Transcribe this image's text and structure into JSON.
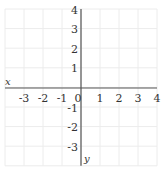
{
  "chart_data": {
    "type": "line",
    "title": "",
    "xlabel": "x",
    "ylabel": "y",
    "xlim": [
      -4,
      4
    ],
    "ylim": [
      -4,
      4
    ],
    "grid": true,
    "x_ticks": [
      -3,
      -2,
      -1,
      0,
      1,
      2,
      3,
      4
    ],
    "y_ticks": [
      4,
      3,
      2,
      1,
      0,
      -1,
      -2,
      -3
    ],
    "series": []
  },
  "colors": {
    "grid": "#ececec",
    "axis": "#555555",
    "text": "#333333"
  },
  "layout": {
    "grid_left": 5,
    "grid_top": 9,
    "cell": 19,
    "cols": 8,
    "rows": 8,
    "origin_x": 81,
    "origin_y": 88
  }
}
